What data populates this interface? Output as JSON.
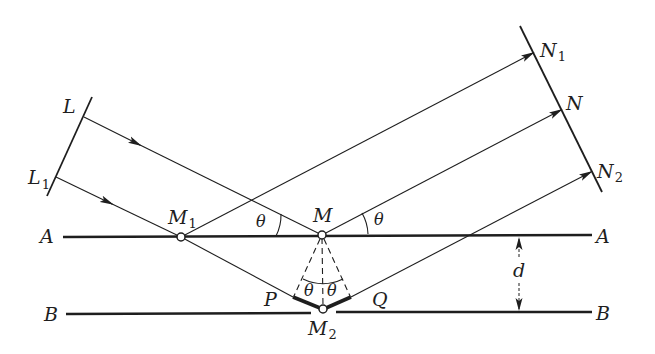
{
  "figure": {
    "colors": {
      "ink": "#1e1e1e",
      "background": "#ffffff"
    },
    "planes": [
      {
        "name": "A",
        "label_left": "A",
        "label_right": "A"
      },
      {
        "name": "B",
        "label_left": "B",
        "label_right": "B"
      }
    ],
    "incident_wavefront": {
      "labels": [
        {
          "main": "L",
          "sub": ""
        },
        {
          "main": "L",
          "sub": "1"
        }
      ]
    },
    "reflected_wavefront": {
      "labels": [
        {
          "main": "N",
          "sub": "1"
        },
        {
          "main": "N",
          "sub": ""
        },
        {
          "main": "N",
          "sub": "2"
        }
      ]
    },
    "points": {
      "M1": {
        "main": "M",
        "sub": "1"
      },
      "M": {
        "main": "M",
        "sub": ""
      },
      "M2": {
        "main": "M",
        "sub": "2"
      },
      "P": {
        "main": "P"
      },
      "Q": {
        "main": "Q"
      }
    },
    "angle_symbol": "θ",
    "spacing_label": "d"
  }
}
